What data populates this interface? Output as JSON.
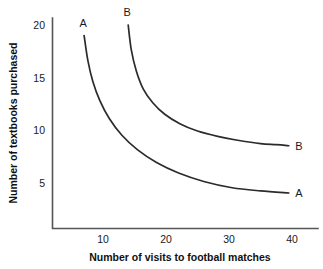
{
  "chart_data": {
    "type": "line",
    "title": "",
    "xlabel": "Number of visits to football matches",
    "ylabel": "Number of textbooks purchased",
    "xlim": [
      0,
      44
    ],
    "ylim": [
      0,
      21.8
    ],
    "grid": false,
    "legend_position": "inline-right",
    "xticks": [
      10,
      20,
      30,
      40
    ],
    "yticks": [
      5,
      10,
      15,
      20
    ],
    "xtick_labels": [
      "10",
      "20",
      "30",
      "40"
    ],
    "ytick_labels": [
      "5",
      "10",
      "15",
      "20"
    ],
    "series": [
      {
        "name": "A",
        "label_start": "A",
        "label_end": "A",
        "points": [
          [
            7.0,
            19.0
          ],
          [
            7.6,
            16.6
          ],
          [
            8.4,
            14.6
          ],
          [
            9.5,
            12.8
          ],
          [
            11.0,
            11.1
          ],
          [
            13.0,
            9.5
          ],
          [
            15.5,
            8.1
          ],
          [
            18.5,
            6.9
          ],
          [
            22.0,
            5.9
          ],
          [
            26.0,
            5.1
          ],
          [
            30.5,
            4.5
          ],
          [
            35.0,
            4.2
          ],
          [
            39.5,
            4.0
          ]
        ]
      },
      {
        "name": "B",
        "label_start": "B",
        "label_end": "B",
        "points": [
          [
            14.0,
            20.0
          ],
          [
            14.5,
            17.6
          ],
          [
            15.3,
            15.6
          ],
          [
            16.4,
            13.9
          ],
          [
            17.9,
            12.6
          ],
          [
            19.8,
            11.5
          ],
          [
            22.2,
            10.6
          ],
          [
            25.0,
            9.9
          ],
          [
            28.2,
            9.4
          ],
          [
            31.6,
            9.0
          ],
          [
            35.0,
            8.7
          ],
          [
            37.5,
            8.6
          ],
          [
            39.5,
            8.5
          ]
        ]
      }
    ]
  },
  "axes": {
    "y_title": "Number of textbooks purchased",
    "x_title": "Number of visits to football matches"
  },
  "labels": {
    "curve_a_top": "A",
    "curve_a_end": "A",
    "curve_b_top": "B",
    "curve_b_end": "B"
  },
  "ticks": {
    "y": [
      "20",
      "15",
      "10",
      "5"
    ],
    "x": [
      "10",
      "20",
      "30",
      "40"
    ]
  },
  "colors": {
    "background": "#ffffff",
    "axis": "#555555",
    "curve": "#2b2b2b",
    "text": "#1a1a1a"
  }
}
